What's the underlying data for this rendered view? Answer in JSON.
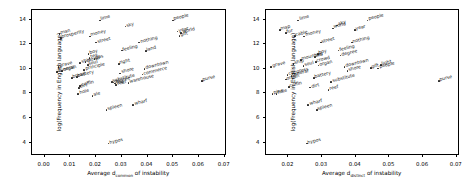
{
  "figure": {
    "panels": [
      "left",
      "right"
    ]
  },
  "axis": {
    "ylabel": "log(Frequency in English language)",
    "xlabel_prefix": "Average d",
    "xlabel_sub_left": "common",
    "xlabel_sub_right": "distinct",
    "xlabel_suffix": " of instability",
    "yticks": [
      "4",
      "6",
      "8",
      "10",
      "12",
      "14"
    ],
    "ytick_values": [
      4,
      6,
      8,
      10,
      12,
      14
    ],
    "xticks_left": [
      "0.00",
      "0.01",
      "0.02",
      "0.03",
      "0.04",
      "0.05",
      "0.06",
      "0.07"
    ],
    "xtick_values_left": [
      0.0,
      0.01,
      0.02,
      0.03,
      0.04,
      0.05,
      0.06,
      0.07
    ],
    "xticks_right": [
      "0.02",
      "0.03",
      "0.04",
      "0.05",
      "0.06",
      "0.07"
    ],
    "xtick_values_right": [
      0.02,
      0.03,
      0.04,
      0.05,
      0.06,
      0.07
    ]
  },
  "chart_data": [
    {
      "type": "scatter",
      "title": "",
      "xlabel": "Average d_common of instability",
      "ylabel": "log(Frequency in English language)",
      "xlim": [
        -0.0045,
        0.0705
      ],
      "ylim": [
        3.0,
        14.7
      ],
      "grid": false,
      "legend": "none",
      "marker_color": "#222222",
      "points": [
        {
          "label": "man",
          "x": 0.0062,
          "y": 12.75
        },
        {
          "label": "prosperity",
          "x": 0.0068,
          "y": 12.45
        },
        {
          "label": "grave",
          "x": 0.0058,
          "y": 10.05
        },
        {
          "label": "funeral",
          "x": 0.0053,
          "y": 9.65
        },
        {
          "label": "organ",
          "x": 0.0072,
          "y": 9.72
        },
        {
          "label": "bread",
          "x": 0.011,
          "y": 9.15
        },
        {
          "label": "battery",
          "x": 0.013,
          "y": 9.28
        },
        {
          "label": "hole",
          "x": 0.0135,
          "y": 7.85
        },
        {
          "label": "ale",
          "x": 0.019,
          "y": 7.7
        },
        {
          "label": "dirt",
          "x": 0.0138,
          "y": 8.35
        },
        {
          "label": "coffin",
          "x": 0.0142,
          "y": 8.5
        },
        {
          "label": "ship",
          "x": 0.0142,
          "y": 10.4
        },
        {
          "label": "principle",
          "x": 0.0158,
          "y": 9.85
        },
        {
          "label": "crowd",
          "x": 0.0163,
          "y": 10.45
        },
        {
          "label": "soul",
          "x": 0.0172,
          "y": 10.22
        },
        {
          "label": "boy",
          "x": 0.0175,
          "y": 11.1
        },
        {
          "label": "tea",
          "x": 0.0178,
          "y": 10.8
        },
        {
          "label": "money",
          "x": 0.018,
          "y": 12.55
        },
        {
          "label": "gas",
          "x": 0.0198,
          "y": 10.7
        },
        {
          "label": "street",
          "x": 0.0205,
          "y": 12.05
        },
        {
          "label": "lime",
          "x": 0.0218,
          "y": 13.85
        },
        {
          "label": "spleen",
          "x": 0.0245,
          "y": 6.55
        },
        {
          "label": "hypos",
          "x": 0.0252,
          "y": 3.85
        },
        {
          "label": "substitute",
          "x": 0.0265,
          "y": 8.85
        },
        {
          "label": "degree",
          "x": 0.0272,
          "y": 8.8
        },
        {
          "label": "fog",
          "x": 0.0278,
          "y": 8.72
        },
        {
          "label": "reef",
          "x": 0.0282,
          "y": 8.6
        },
        {
          "label": "right",
          "x": 0.0292,
          "y": 10.3
        },
        {
          "label": "shore",
          "x": 0.0298,
          "y": 9.55
        },
        {
          "label": "feeling",
          "x": 0.0305,
          "y": 11.4
        },
        {
          "label": "sky",
          "x": 0.0318,
          "y": 13.35
        },
        {
          "label": "warehouse",
          "x": 0.033,
          "y": 8.78
        },
        {
          "label": "wharf",
          "x": 0.0348,
          "y": 7.0
        },
        {
          "label": "nothing",
          "x": 0.0372,
          "y": 12.05
        },
        {
          "label": "commerce",
          "x": 0.0385,
          "y": 9.45
        },
        {
          "label": "downtown",
          "x": 0.0392,
          "y": 9.9
        },
        {
          "label": "land",
          "x": 0.0398,
          "y": 11.35
        },
        {
          "label": "people",
          "x": 0.0502,
          "y": 13.85
        },
        {
          "label": "year",
          "x": 0.052,
          "y": 12.95
        },
        {
          "label": "world",
          "x": 0.0535,
          "y": 12.85
        },
        {
          "label": "gift",
          "x": 0.0528,
          "y": 12.6
        },
        {
          "label": "purse",
          "x": 0.0615,
          "y": 8.95
        }
      ]
    },
    {
      "type": "scatter",
      "title": "",
      "xlabel": "Average d_distinct of instability",
      "ylabel": "log(Frequency in English language)",
      "xlim": [
        0.0135,
        0.0708
      ],
      "ylim": [
        3.0,
        14.7
      ],
      "grid": false,
      "legend": "none",
      "marker_color": "#222222",
      "points": [
        {
          "label": "grave",
          "x": 0.0152,
          "y": 10.05
        },
        {
          "label": "pine",
          "x": 0.0156,
          "y": 7.85
        },
        {
          "label": "hole",
          "x": 0.0168,
          "y": 7.88
        },
        {
          "label": "map",
          "x": 0.0178,
          "y": 13.1
        },
        {
          "label": "fur",
          "x": 0.0195,
          "y": 12.85
        },
        {
          "label": "organ",
          "x": 0.0196,
          "y": 9.05
        },
        {
          "label": "congress",
          "x": 0.02,
          "y": 9.4
        },
        {
          "label": "coffin",
          "x": 0.0205,
          "y": 8.45
        },
        {
          "label": "funeral",
          "x": 0.0212,
          "y": 9.35
        },
        {
          "label": "ship",
          "x": 0.0218,
          "y": 10.3
        },
        {
          "label": "cable",
          "x": 0.0222,
          "y": 12.6
        },
        {
          "label": "lime",
          "x": 0.0232,
          "y": 13.85
        },
        {
          "label": "mountain",
          "x": 0.024,
          "y": 10.65
        },
        {
          "label": "money",
          "x": 0.025,
          "y": 12.55
        },
        {
          "label": "soul",
          "x": 0.0248,
          "y": 10.15
        },
        {
          "label": "hypos",
          "x": 0.0258,
          "y": 3.85
        },
        {
          "label": "wharf",
          "x": 0.0262,
          "y": 7.0
        },
        {
          "label": "dirt",
          "x": 0.0268,
          "y": 8.4
        },
        {
          "label": "battery",
          "x": 0.0278,
          "y": 9.2
        },
        {
          "label": "tea",
          "x": 0.0282,
          "y": 10.9
        },
        {
          "label": "crowd",
          "x": 0.0285,
          "y": 10.45
        },
        {
          "label": "spleen",
          "x": 0.0288,
          "y": 6.55
        },
        {
          "label": "boy",
          "x": 0.029,
          "y": 11.1
        },
        {
          "label": "organ2",
          "x": 0.0292,
          "y": 10.18
        },
        {
          "label": "street",
          "x": 0.03,
          "y": 12.05
        },
        {
          "label": "reef",
          "x": 0.0322,
          "y": 8.2
        },
        {
          "label": "substitute",
          "x": 0.033,
          "y": 8.85
        },
        {
          "label": "world",
          "x": 0.0335,
          "y": 13.2
        },
        {
          "label": "sky",
          "x": 0.0348,
          "y": 13.45
        },
        {
          "label": "feeling",
          "x": 0.0352,
          "y": 11.4
        },
        {
          "label": "degree",
          "x": 0.0358,
          "y": 11.0
        },
        {
          "label": "downtown",
          "x": 0.037,
          "y": 10.05
        },
        {
          "label": "shore",
          "x": 0.0378,
          "y": 9.72
        },
        {
          "label": "nothing",
          "x": 0.0392,
          "y": 12.05
        },
        {
          "label": "year",
          "x": 0.04,
          "y": 13.05
        },
        {
          "label": "people",
          "x": 0.0438,
          "y": 13.85
        },
        {
          "label": "gift",
          "x": 0.0448,
          "y": 10.0
        },
        {
          "label": "people2",
          "x": 0.047,
          "y": 9.95
        },
        {
          "label": "light",
          "x": 0.0478,
          "y": 10.25
        },
        {
          "label": "purse",
          "x": 0.065,
          "y": 8.95
        }
      ]
    }
  ]
}
